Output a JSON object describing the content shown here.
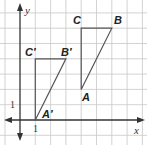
{
  "diagram": {
    "type": "coordinate-plane-translation",
    "axes": {
      "x_label": "x",
      "y_label": "y",
      "tick_x": "1",
      "tick_y": "1"
    },
    "grid": {
      "x_range": [
        -1,
        8
      ],
      "y_range": [
        -1,
        7
      ],
      "unit": 1
    },
    "triangles": [
      {
        "name": "ABC",
        "vertices": {
          "A": [
            4,
            2
          ],
          "B": [
            6,
            6
          ],
          "C": [
            4,
            6
          ]
        },
        "labels": {
          "A": "A",
          "B": "B",
          "C": "C"
        }
      },
      {
        "name": "A'B'C'",
        "vertices": {
          "A'": [
            1,
            0
          ],
          "B'": [
            3,
            4
          ],
          "C'": [
            1,
            4
          ]
        },
        "labels": {
          "A": "A′",
          "B": "B′",
          "C": "C′"
        }
      }
    ],
    "colors": {
      "grid": "#c8c8c8",
      "axis": "#333333",
      "triangle": "#555555",
      "background": "#ffffff"
    }
  }
}
